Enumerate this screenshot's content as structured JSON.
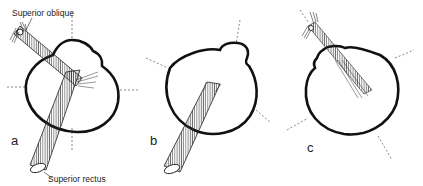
{
  "figure": {
    "colors": {
      "outline": "#111111",
      "muscle": "#333333",
      "dashed": "#555555",
      "background": "#ffffff"
    },
    "panels": [
      {
        "id": "a",
        "letter": "a",
        "muscles_shown": [
          "Superior oblique",
          "Superior rectus"
        ]
      },
      {
        "id": "b",
        "letter": "b",
        "muscles_shown": [
          "Superior rectus"
        ]
      },
      {
        "id": "c",
        "letter": "c",
        "muscles_shown": [
          "Superior oblique"
        ]
      }
    ],
    "labels": {
      "superior_oblique": "Superior oblique",
      "superior_rectus": "Superior rectus"
    }
  }
}
